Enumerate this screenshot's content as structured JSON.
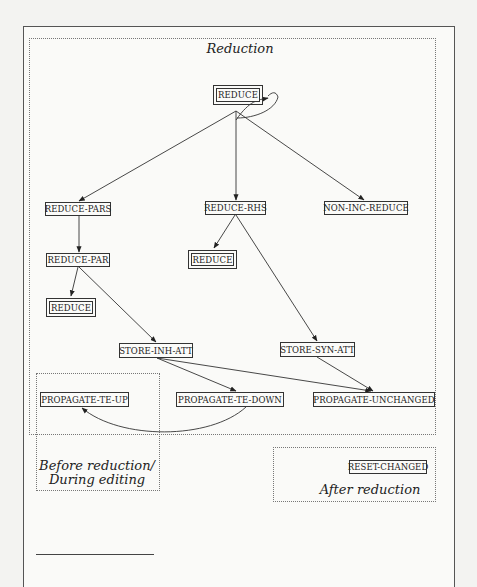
{
  "figure": {
    "regions": {
      "reduction": {
        "label": "Reduction"
      },
      "before": {
        "label_line1": "Before reduction/",
        "label_line2": "During editing"
      },
      "after": {
        "label": "After reduction"
      }
    },
    "nodes": {
      "reduce_top": "REDUCE",
      "reduce_pars": "REDUCE-PARS",
      "reduce_rhs": "REDUCE-RHS",
      "non_inc_reduce": "NON-INC-REDUCE",
      "reduce_par": "REDUCE-PAR",
      "reduce_mid": "REDUCE",
      "reduce_left": "REDUCE",
      "store_inh_att": "STORE-INH-ATT",
      "store_syn_att": "STORE-SYN-ATT",
      "propagate_te_up": "PROPAGATE-TE-UP",
      "propagate_te_down": "PROPAGATE-TE-DOWN",
      "propagate_unchanged": "PROPAGATE-UNCHANGED",
      "reset_changed": "RESET-CHANGED"
    },
    "edges": [
      [
        "REDUCE",
        "REDUCE (self-loop)"
      ],
      [
        "REDUCE",
        "REDUCE-PARS"
      ],
      [
        "REDUCE",
        "REDUCE-RHS"
      ],
      [
        "REDUCE",
        "NON-INC-REDUCE"
      ],
      [
        "REDUCE-PARS",
        "REDUCE-PAR"
      ],
      [
        "REDUCE-PAR",
        "REDUCE"
      ],
      [
        "REDUCE-PAR",
        "STORE-INH-ATT"
      ],
      [
        "REDUCE-RHS",
        "REDUCE"
      ],
      [
        "REDUCE-RHS",
        "STORE-SYN-ATT"
      ],
      [
        "STORE-INH-ATT",
        "PROPAGATE-TE-DOWN"
      ],
      [
        "STORE-INH-ATT",
        "PROPAGATE-UNCHANGED"
      ],
      [
        "STORE-SYN-ATT",
        "PROPAGATE-UNCHANGED"
      ],
      [
        "PROPAGATE-TE-DOWN",
        "PROPAGATE-TE-UP"
      ]
    ],
    "legend": {
      "double_box": "calls REDUCE recursively"
    }
  }
}
